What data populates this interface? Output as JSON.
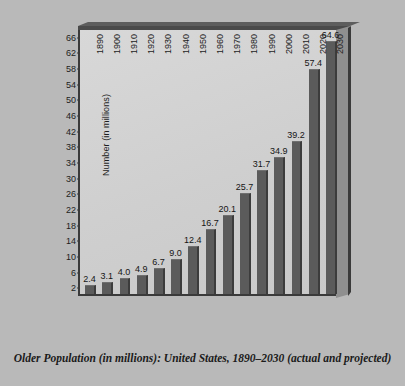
{
  "chart_data": {
    "type": "bar",
    "title": "Older Population (in millions): United States, 1890–2030 (actual and projected)",
    "xlabel": "",
    "ylabel": "Number (in millions)",
    "categories": [
      "1890",
      "1900",
      "1910",
      "1920",
      "1930",
      "1940",
      "1950",
      "1960",
      "1970",
      "1980",
      "1990",
      "2000",
      "2010",
      "2020",
      "2030"
    ],
    "values": [
      2.4,
      3.1,
      4.0,
      4.9,
      6.7,
      9.0,
      12.4,
      16.7,
      20.1,
      25.7,
      31.7,
      34.9,
      39.2,
      57.4,
      64.6
    ],
    "value_labels": [
      "2.4",
      "3.1",
      "4.0",
      "4.9",
      "6.7",
      "9.0",
      "12.4",
      "16.7",
      "20.1",
      "25.7",
      "31.7",
      "34.9",
      "39.2",
      "57.4",
      "64.6"
    ],
    "ylim": [
      0,
      68
    ],
    "yticks": [
      2,
      6,
      10,
      14,
      18,
      22,
      26,
      30,
      34,
      38,
      42,
      46,
      50,
      54,
      58,
      62,
      66
    ],
    "ytick_labels": [
      "2",
      "6",
      "10",
      "14",
      "18",
      "22",
      "26",
      "30",
      "34",
      "38",
      "42",
      "46",
      "50",
      "54",
      "58",
      "62",
      "66"
    ],
    "grid": false,
    "legend": false,
    "legend_position": "none",
    "bar_color": "#5b5b5b",
    "plot_background": "#d2d2d2",
    "figure_background": "#b9b9b9",
    "axis_color": "#3a3a3a",
    "style": "3d-frame"
  },
  "caption": {
    "text": "Older Population (in millions): United States, 1890–2030 (actual and projected)"
  }
}
